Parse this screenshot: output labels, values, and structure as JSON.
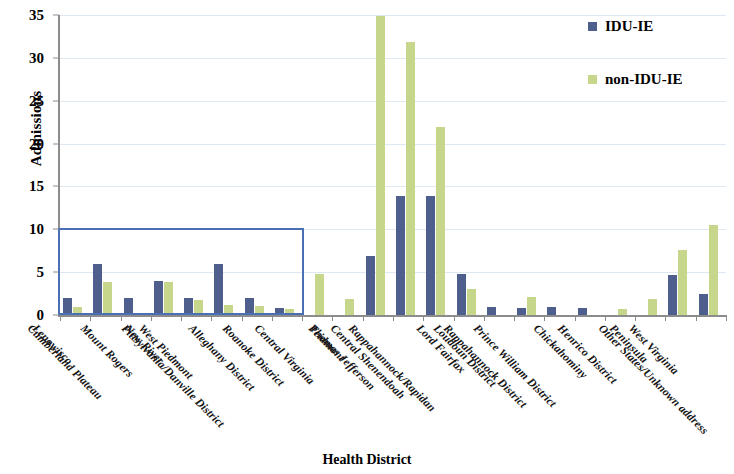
{
  "chart_data": {
    "type": "bar",
    "title": "",
    "xlabel": "Health District",
    "ylabel": "Admissions",
    "ylim": [
      0,
      35
    ],
    "ytick_values": [
      0,
      5,
      10,
      15,
      20,
      25,
      30,
      35
    ],
    "grid": true,
    "legend_position": "top-right",
    "categories": [
      "Lenowisco",
      "Cumberland Plateau",
      "Mount Rogers",
      "New River",
      "West Piedmont",
      "Pittsylvania/Danville District",
      "Alleghany District",
      "Roanoke District",
      "Central Virginia",
      "Peidmont",
      "Thomas Jefferson",
      "Central Shenendoah",
      "Rappahannock/Rapidan",
      "Lord Fairfax",
      "Loudoun District",
      "Rappahannock District",
      "Prince William District",
      "Chickahominy",
      "Henrico District",
      "Peninsula",
      "West Virginia",
      "Other States/Unknown address"
    ],
    "series": [
      {
        "name": "IDU-IE",
        "color": "#4f5f8d",
        "values": [
          2.0,
          6.0,
          2.0,
          4.0,
          2.0,
          6.0,
          2.0,
          0.8,
          0,
          0,
          6.9,
          13.9,
          13.9,
          4.8,
          0.9,
          0.8,
          0.9,
          0.8,
          0,
          0,
          4.7,
          2.5
        ]
      },
      {
        "name": "non-IDU-IE",
        "color": "#c6d78c",
        "values": [
          0.9,
          3.9,
          0,
          3.9,
          1.7,
          1.2,
          1.1,
          0.7,
          4.8,
          1.9,
          34.9,
          31.9,
          21.9,
          3.0,
          0,
          2.1,
          0,
          0,
          0.7,
          1.9,
          7.6,
          10.5
        ]
      }
    ],
    "annotations": [
      {
        "type": "rectangle",
        "name": "highlight-box",
        "color": "#4a6fb5",
        "x_start_category": "Lenowisco",
        "x_end_category": "Roanoke District",
        "y_top": 10.2,
        "y_bottom": 0
      }
    ]
  },
  "axes": {
    "y_title": "Admissions",
    "x_title": "Health District"
  },
  "legend": {
    "items": [
      {
        "label": "IDU-IE",
        "color": "#4f5f8d"
      },
      {
        "label": "non-IDU-IE",
        "color": "#c6d78c"
      }
    ]
  }
}
